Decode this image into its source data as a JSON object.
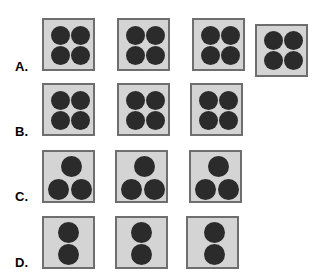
{
  "figure": {
    "type": "dot-pattern-grid",
    "background_color": "#ffffff",
    "tile_fill_color": "#d4d4d4",
    "tile_border_color": "#6e6e6e",
    "dot_color": "#2b2b2b",
    "label_color": "#000000"
  },
  "rows": [
    {
      "label": "A.",
      "label_x": 15,
      "label_y": 60,
      "dots_per_tile": 4,
      "tile_count": 4,
      "tile_size": 53,
      "dot_diameter": 19,
      "arrangement": "2x2",
      "tiles": [
        {
          "x": 42,
          "y": 18,
          "dots": [
            [
              7,
              6
            ],
            [
              27,
              6
            ],
            [
              7,
              26
            ],
            [
              27,
              26
            ]
          ]
        },
        {
          "x": 117,
          "y": 18,
          "dots": [
            [
              7,
              6
            ],
            [
              27,
              6
            ],
            [
              7,
              26
            ],
            [
              27,
              26
            ]
          ]
        },
        {
          "x": 192,
          "y": 18,
          "dots": [
            [
              7,
              6
            ],
            [
              27,
              6
            ],
            [
              7,
              26
            ],
            [
              27,
              26
            ]
          ]
        },
        {
          "x": 255,
          "y": 24,
          "dots": [
            [
              7,
              5
            ],
            [
              27,
              5
            ],
            [
              7,
              25
            ],
            [
              27,
              25
            ]
          ]
        }
      ]
    },
    {
      "label": "B.",
      "label_x": 15,
      "label_y": 125,
      "dots_per_tile": 4,
      "tile_count": 3,
      "tile_size": 53,
      "dot_diameter": 19,
      "arrangement": "2x2",
      "tiles": [
        {
          "x": 42,
          "y": 83,
          "dots": [
            [
              7,
              6
            ],
            [
              27,
              6
            ],
            [
              7,
              26
            ],
            [
              27,
              26
            ]
          ]
        },
        {
          "x": 117,
          "y": 83,
          "dots": [
            [
              7,
              6
            ],
            [
              27,
              6
            ],
            [
              7,
              26
            ],
            [
              27,
              26
            ]
          ]
        },
        {
          "x": 190,
          "y": 83,
          "dots": [
            [
              7,
              6
            ],
            [
              27,
              6
            ],
            [
              7,
              26
            ],
            [
              27,
              26
            ]
          ]
        }
      ]
    },
    {
      "label": "C.",
      "label_x": 15,
      "label_y": 190,
      "dots_per_tile": 3,
      "tile_count": 3,
      "tile_size": 53,
      "dot_diameter": 21,
      "arrangement": "triangle-1-top-2-bottom",
      "tiles": [
        {
          "x": 42,
          "y": 150,
          "dots": [
            [
              17,
              4
            ],
            [
              4,
              27
            ],
            [
              27,
              27
            ]
          ]
        },
        {
          "x": 115,
          "y": 150,
          "dots": [
            [
              17,
              4
            ],
            [
              4,
              27
            ],
            [
              27,
              27
            ]
          ]
        },
        {
          "x": 189,
          "y": 150,
          "dots": [
            [
              17,
              4
            ],
            [
              4,
              27
            ],
            [
              27,
              27
            ]
          ]
        }
      ]
    },
    {
      "label": "D.",
      "label_x": 15,
      "label_y": 256,
      "dots_per_tile": 2,
      "tile_count": 3,
      "tile_size": 53,
      "dot_diameter": 21,
      "arrangement": "vertical-pair",
      "tiles": [
        {
          "x": 42,
          "y": 216,
          "dots": [
            [
              14,
              4
            ],
            [
              14,
              26
            ]
          ]
        },
        {
          "x": 115,
          "y": 216,
          "dots": [
            [
              14,
              4
            ],
            [
              14,
              26
            ]
          ]
        },
        {
          "x": 186,
          "y": 216,
          "dots": [
            [
              16,
              4
            ],
            [
              16,
              26
            ]
          ]
        }
      ]
    }
  ],
  "chart_data": {
    "type": "table",
    "title": "",
    "categories": [
      "A",
      "B",
      "C",
      "D"
    ],
    "series": [
      {
        "name": "tiles per row",
        "values": [
          4,
          3,
          3,
          3
        ]
      },
      {
        "name": "dots per tile",
        "values": [
          4,
          4,
          3,
          2
        ]
      },
      {
        "name": "total dots per row",
        "values": [
          16,
          12,
          9,
          6
        ]
      }
    ],
    "xlabel": "Row",
    "ylabel": "Count",
    "grid": false,
    "legend": "none"
  }
}
